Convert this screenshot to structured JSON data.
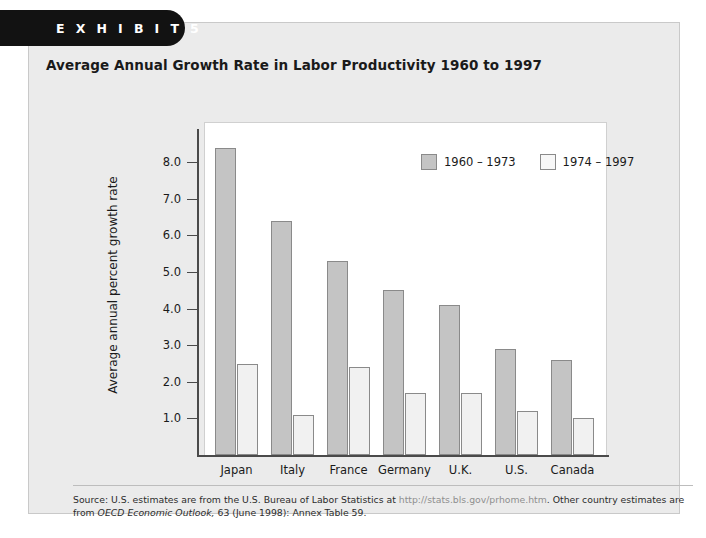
{
  "exhibit": {
    "tab_label": "E X H I B I T   5",
    "title": "Average Annual Growth Rate in Labor Productivity 1960 to 1997"
  },
  "source": {
    "lead": "Source: U.S. estimates are from the U.S. Bureau of Labor Statistics at ",
    "url": "http://stats.bls.gov/prhome.htm",
    "mid": ". Other country estimates are from ",
    "italic1": "OECD Economic Outlook,",
    "tail": " 63 (June 1998): Annex Table 59."
  },
  "legend": {
    "items": [
      {
        "label": "1960 – 1973",
        "color": "#c4c4c4"
      },
      {
        "label": "1974 – 1997",
        "color": "#f7f7f7"
      }
    ]
  },
  "chart_data": {
    "type": "bar",
    "title": "Average Annual Growth Rate in Labor Productivity 1960 to 1997",
    "xlabel": "",
    "ylabel": "Average annual percent growth rate",
    "categories": [
      "Japan",
      "Italy",
      "France",
      "Germany",
      "U.K.",
      "U.S.",
      "Canada"
    ],
    "series": [
      {
        "name": "1960 – 1973",
        "values": [
          8.4,
          6.4,
          5.3,
          4.5,
          4.1,
          2.9,
          2.6
        ]
      },
      {
        "name": "1974 – 1997",
        "values": [
          2.5,
          1.1,
          2.4,
          1.7,
          1.7,
          1.2,
          1.0
        ]
      }
    ],
    "ylim": [
      0,
      8.6
    ],
    "yticks": [
      "1.0",
      "2.0",
      "3.0",
      "4.0",
      "5.0",
      "6.0",
      "7.0",
      "8.0"
    ],
    "ytick_values": [
      1.0,
      2.0,
      3.0,
      4.0,
      5.0,
      6.0,
      7.0,
      8.0
    ],
    "grid": false,
    "legend_position": "top-right"
  }
}
